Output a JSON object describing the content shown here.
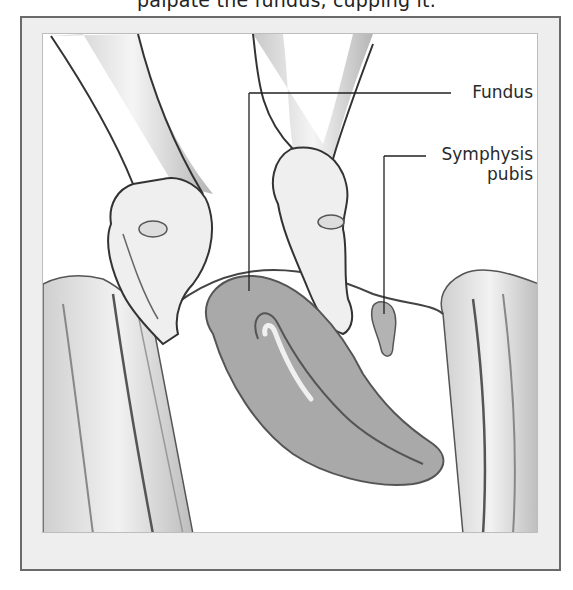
{
  "caption": {
    "text": "palpate the fundus, cupping it."
  },
  "figure": {
    "labels": [
      {
        "id": "fundus",
        "text": "Fundus"
      },
      {
        "id": "symphysis",
        "line1": "Symphysis",
        "line2": "pubis"
      }
    ],
    "colors": {
      "frame_bg": "#eeeeee",
      "frame_border": "#6a6a6a",
      "uterus_fill": "#a9a9a9",
      "ink": "#2a2a2a"
    }
  }
}
